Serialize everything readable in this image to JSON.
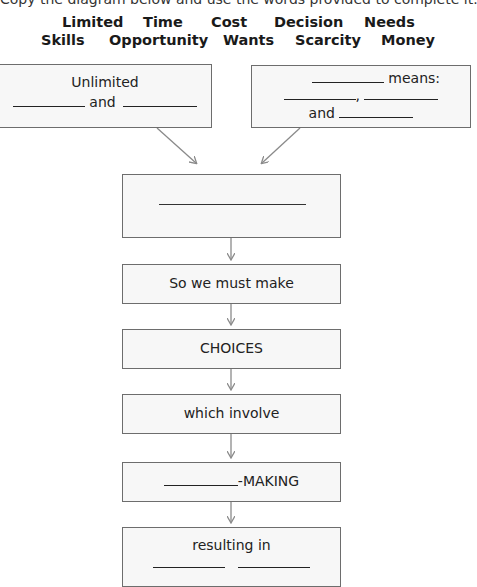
{
  "instruction": "Copy the diagram below and use the words provided to complete it.",
  "word_bank": {
    "row1": [
      "Limited",
      "Time",
      "Cost",
      "Decision",
      "Needs"
    ],
    "row2": [
      "Skills",
      "Opportunity",
      "Wants",
      "Scarcity",
      "Money"
    ]
  },
  "diagram": {
    "box_left": {
      "line1": "Unlimited",
      "connector": "and"
    },
    "box_right": {
      "suffix": "means:",
      "separator": ",",
      "connector": "and"
    },
    "box_center": {
      "blank": ""
    },
    "box_must": {
      "text": "So we must make"
    },
    "box_choices": {
      "text": "CHOICES"
    },
    "box_involve": {
      "text": "which involve"
    },
    "box_making": {
      "suffix": "-MAKING"
    },
    "box_result": {
      "text": "resulting in"
    }
  },
  "colors": {
    "box_border": "#6d6d6d",
    "box_fill": "#f7f7f7",
    "arrow": "#8a8a8a",
    "text": "#1e1e1e"
  }
}
